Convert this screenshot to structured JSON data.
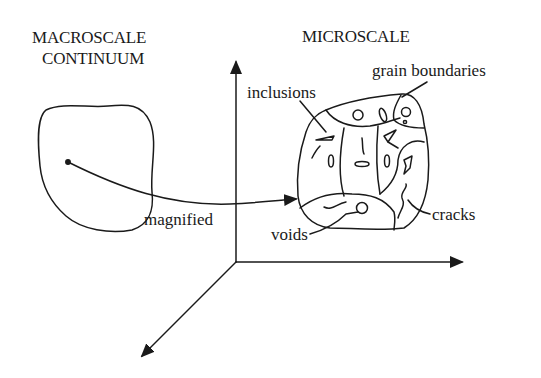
{
  "diagram": {
    "macroscale": {
      "title_line1": "MACROSCALE",
      "title_line2": "CONTINUUM"
    },
    "microscale": {
      "title": "MICROSCALE"
    },
    "annotations": {
      "grain_boundaries": "grain boundaries",
      "inclusions": "inclusions",
      "cracks": "cracks",
      "voids": "voids",
      "magnified": "magnified"
    },
    "colors": {
      "ink": "#1a1a1a",
      "background": "#ffffff",
      "bleed_through_text": "#ececec"
    }
  }
}
